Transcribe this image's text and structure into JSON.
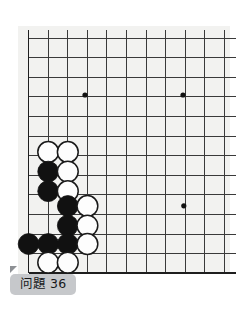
{
  "page": {
    "background_color": "#ffffff",
    "board_paper_color": "#f2f2f0"
  },
  "caption": {
    "label": "问題 36",
    "background_color": "#c6c8cb",
    "text_color": "#16181a"
  },
  "board": {
    "type": "go-board-diagram",
    "origin_x": 28.5,
    "origin_y": 38.0,
    "cell": 19.6,
    "cols": 10,
    "rows": 12,
    "line_color": "#3a3a3a",
    "edge_line_color": "#1e1e1e",
    "line_width": 1.0,
    "edge_line_width": 1.9,
    "star_point_color": "#111111",
    "star_point_radius": 2.6,
    "star_points": [
      {
        "cx": 85.0,
        "cy": 95.0
      },
      {
        "cx": 183.0,
        "cy": 95.0
      },
      {
        "cx": 183.8,
        "cy": 205.8
      }
    ],
    "stone_radius": 10.4,
    "black_color": "#111111",
    "white_color": "#fdfdfd",
    "white_outline_color": "#1a1a1a",
    "stones": [
      {
        "color": "white",
        "cx": 48.2,
        "cy": 152.0
      },
      {
        "color": "white",
        "cx": 67.8,
        "cy": 152.0
      },
      {
        "color": "black",
        "cx": 48.2,
        "cy": 171.6
      },
      {
        "color": "white",
        "cx": 67.8,
        "cy": 171.6
      },
      {
        "color": "black",
        "cx": 48.2,
        "cy": 191.2
      },
      {
        "color": "white",
        "cx": 67.8,
        "cy": 191.2
      },
      {
        "color": "black",
        "cx": 67.8,
        "cy": 206.0
      },
      {
        "color": "white",
        "cx": 87.4,
        "cy": 206.0
      },
      {
        "color": "black",
        "cx": 67.8,
        "cy": 225.6
      },
      {
        "color": "white",
        "cx": 87.4,
        "cy": 225.6
      },
      {
        "color": "black",
        "cx": 28.6,
        "cy": 244.0
      },
      {
        "color": "black",
        "cx": 48.2,
        "cy": 244.0
      },
      {
        "color": "black",
        "cx": 67.8,
        "cy": 244.0
      },
      {
        "color": "white",
        "cx": 87.4,
        "cy": 244.0
      },
      {
        "color": "white",
        "cx": 48.2,
        "cy": 262.6
      },
      {
        "color": "white",
        "cx": 67.8,
        "cy": 262.6
      }
    ]
  }
}
